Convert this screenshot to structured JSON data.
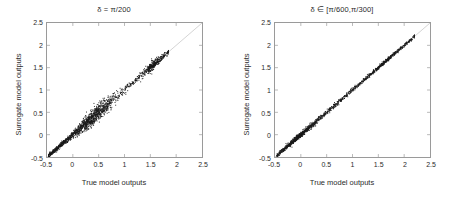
{
  "figure": {
    "background": "#ffffff",
    "point_color": "#1a1a1a",
    "reference_line_color": "#c8c8c8",
    "axis_color": "#9a9a9a"
  },
  "panels": [
    {
      "id": "left",
      "title": "δ = π/200",
      "xlabel": "True model outputs",
      "ylabel": "Surrogate model outputs"
    },
    {
      "id": "right",
      "title": "δ ∈ [π/600,π/300]",
      "xlabel": "True model outputs",
      "ylabel": "Surrogate model outputs"
    }
  ],
  "axis_ticks": {
    "x": [
      "-0.5",
      "0",
      "0.5",
      "1",
      "1.5",
      "2",
      "2.5"
    ],
    "y": [
      "-0.5",
      "0",
      "0.5",
      "1",
      "1.5",
      "2",
      "2.5"
    ]
  },
  "chart_data": [
    {
      "type": "scatter",
      "title": "δ = π/200",
      "xlabel": "True model outputs",
      "ylabel": "Surrogate model outputs",
      "xlim": [
        -0.5,
        2.5
      ],
      "ylim": [
        -0.5,
        2.5
      ],
      "xticks": [
        -0.5,
        0,
        0.5,
        1,
        1.5,
        2,
        2.5
      ],
      "yticks": [
        -0.5,
        0,
        0.5,
        1,
        1.5,
        2,
        2.5
      ],
      "grid": false,
      "legend": "none",
      "annotations": [
        "identity reference line y = x drawn in light gray across full axes range",
        "dense black point cloud hugging the diagonal from about -0.45 to 1.85",
        "visible vertical scatter spread widest between x = 0.2 and x = 0.8",
        "a secondary denser knot of points near x = 1.45 to 1.7"
      ],
      "marker": {
        "style": "dot",
        "size": 1.2,
        "color": "#1a1a1a"
      },
      "reference_line": {
        "slope": 1,
        "intercept": 0,
        "color": "#c8c8c8"
      },
      "n_points_approx": 1600,
      "data_x_range": [
        -0.47,
        1.85
      ],
      "data_y_range": [
        -0.47,
        1.83
      ],
      "residual_spread": "moderate; scatter band roughly +/-0.08 in y about the identity line, widening to +/-0.15 near x = 0.5",
      "points": [
        [
          -0.47,
          -0.47
        ],
        [
          -0.45,
          -0.46
        ],
        [
          -0.43,
          -0.44
        ],
        [
          -0.41,
          -0.42
        ],
        [
          -0.39,
          -0.4
        ],
        [
          -0.36,
          -0.37
        ],
        [
          -0.34,
          -0.35
        ],
        [
          -0.31,
          -0.32
        ],
        [
          -0.29,
          -0.29
        ],
        [
          -0.26,
          -0.27
        ],
        [
          -0.24,
          -0.25
        ],
        [
          -0.21,
          -0.21
        ],
        [
          -0.19,
          -0.2
        ],
        [
          -0.16,
          -0.17
        ],
        [
          -0.14,
          -0.13
        ],
        [
          -0.11,
          -0.12
        ],
        [
          -0.09,
          -0.08
        ],
        [
          -0.06,
          -0.07
        ],
        [
          -0.04,
          -0.03
        ],
        [
          -0.01,
          -0.02
        ],
        [
          0.02,
          0.03
        ],
        [
          0.05,
          0.04
        ],
        [
          0.07,
          0.09
        ],
        [
          0.1,
          0.08
        ],
        [
          0.12,
          0.14
        ],
        [
          0.15,
          0.13
        ],
        [
          0.18,
          0.2
        ],
        [
          0.2,
          0.18
        ],
        [
          0.23,
          0.26
        ],
        [
          0.25,
          0.23
        ],
        [
          0.28,
          0.31
        ],
        [
          0.3,
          0.27
        ],
        [
          0.33,
          0.37
        ],
        [
          0.35,
          0.32
        ],
        [
          0.38,
          0.43
        ],
        [
          0.4,
          0.36
        ],
        [
          0.43,
          0.48
        ],
        [
          0.45,
          0.41
        ],
        [
          0.48,
          0.53
        ],
        [
          0.5,
          0.46
        ],
        [
          0.53,
          0.58
        ],
        [
          0.55,
          0.51
        ],
        [
          0.58,
          0.62
        ],
        [
          0.6,
          0.57
        ],
        [
          0.63,
          0.66
        ],
        [
          0.65,
          0.62
        ],
        [
          0.68,
          0.71
        ],
        [
          0.7,
          0.67
        ],
        [
          0.73,
          0.75
        ],
        [
          0.75,
          0.73
        ],
        [
          0.8,
          0.79
        ],
        [
          0.85,
          0.84
        ],
        [
          0.9,
          0.89
        ],
        [
          0.95,
          0.95
        ],
        [
          1.0,
          0.99
        ],
        [
          1.05,
          1.05
        ],
        [
          1.1,
          1.09
        ],
        [
          1.15,
          1.15
        ],
        [
          1.2,
          1.2
        ],
        [
          1.25,
          1.24
        ],
        [
          1.3,
          1.31
        ],
        [
          1.35,
          1.34
        ],
        [
          1.4,
          1.41
        ],
        [
          1.45,
          1.44
        ],
        [
          1.48,
          1.5
        ],
        [
          1.5,
          1.47
        ],
        [
          1.53,
          1.55
        ],
        [
          1.55,
          1.52
        ],
        [
          1.58,
          1.6
        ],
        [
          1.6,
          1.57
        ],
        [
          1.63,
          1.63
        ],
        [
          1.66,
          1.67
        ],
        [
          1.7,
          1.7
        ],
        [
          1.74,
          1.73
        ],
        [
          1.78,
          1.77
        ],
        [
          1.82,
          1.8
        ],
        [
          1.85,
          1.83
        ]
      ]
    },
    {
      "type": "scatter",
      "title": "δ ∈ [π/600,π/300]",
      "xlabel": "True model outputs",
      "ylabel": "Surrogate model outputs",
      "xlim": [
        -0.5,
        2.5
      ],
      "ylim": [
        -0.5,
        2.5
      ],
      "xticks": [
        -0.5,
        0,
        0.5,
        1,
        1.5,
        2,
        2.5
      ],
      "yticks": [
        -0.5,
        0,
        0.5,
        1,
        1.5,
        2,
        2.5
      ],
      "grid": false,
      "legend": "none",
      "annotations": [
        "identity reference line y = x drawn in light gray across full axes range",
        "very tight black point cloud on the diagonal from about -0.45 to 2.20",
        "noticeably narrower scatter band than the left panel",
        "small cluster knots near x = -0.15, x = 0.0 and x = 1.6"
      ],
      "marker": {
        "style": "dot",
        "size": 1.2,
        "color": "#1a1a1a"
      },
      "reference_line": {
        "slope": 1,
        "intercept": 0,
        "color": "#c8c8c8"
      },
      "n_points_approx": 1800,
      "data_x_range": [
        -0.46,
        2.2
      ],
      "data_y_range": [
        -0.46,
        2.18
      ],
      "residual_spread": "tight; scatter band roughly +/-0.04 in y about the identity line across the whole range",
      "points": [
        [
          -0.46,
          -0.46
        ],
        [
          -0.43,
          -0.44
        ],
        [
          -0.4,
          -0.4
        ],
        [
          -0.37,
          -0.38
        ],
        [
          -0.34,
          -0.34
        ],
        [
          -0.31,
          -0.32
        ],
        [
          -0.28,
          -0.28
        ],
        [
          -0.25,
          -0.26
        ],
        [
          -0.22,
          -0.22
        ],
        [
          -0.19,
          -0.2
        ],
        [
          -0.16,
          -0.15
        ],
        [
          -0.13,
          -0.14
        ],
        [
          -0.1,
          -0.1
        ],
        [
          -0.07,
          -0.07
        ],
        [
          -0.04,
          -0.04
        ],
        [
          -0.01,
          -0.01
        ],
        [
          0.02,
          0.02
        ],
        [
          0.05,
          0.05
        ],
        [
          0.09,
          0.08
        ],
        [
          0.12,
          0.13
        ],
        [
          0.15,
          0.15
        ],
        [
          0.19,
          0.18
        ],
        [
          0.22,
          0.23
        ],
        [
          0.26,
          0.25
        ],
        [
          0.29,
          0.3
        ],
        [
          0.33,
          0.32
        ],
        [
          0.36,
          0.37
        ],
        [
          0.4,
          0.39
        ],
        [
          0.43,
          0.44
        ],
        [
          0.47,
          0.46
        ],
        [
          0.5,
          0.51
        ],
        [
          0.54,
          0.53
        ],
        [
          0.57,
          0.58
        ],
        [
          0.61,
          0.6
        ],
        [
          0.64,
          0.65
        ],
        [
          0.68,
          0.67
        ],
        [
          0.71,
          0.72
        ],
        [
          0.75,
          0.74
        ],
        [
          0.79,
          0.79
        ],
        [
          0.83,
          0.82
        ],
        [
          0.87,
          0.87
        ],
        [
          0.91,
          0.9
        ],
        [
          0.95,
          0.95
        ],
        [
          0.99,
          0.98
        ],
        [
          1.03,
          1.03
        ],
        [
          1.07,
          1.06
        ],
        [
          1.11,
          1.11
        ],
        [
          1.15,
          1.14
        ],
        [
          1.19,
          1.19
        ],
        [
          1.23,
          1.22
        ],
        [
          1.27,
          1.27
        ],
        [
          1.31,
          1.3
        ],
        [
          1.35,
          1.36
        ],
        [
          1.39,
          1.38
        ],
        [
          1.43,
          1.44
        ],
        [
          1.47,
          1.46
        ],
        [
          1.51,
          1.52
        ],
        [
          1.55,
          1.54
        ],
        [
          1.59,
          1.61
        ],
        [
          1.63,
          1.62
        ],
        [
          1.67,
          1.68
        ],
        [
          1.71,
          1.7
        ],
        [
          1.75,
          1.76
        ],
        [
          1.79,
          1.78
        ],
        [
          1.83,
          1.83
        ],
        [
          1.87,
          1.86
        ],
        [
          1.91,
          1.91
        ],
        [
          1.95,
          1.94
        ],
        [
          1.99,
          1.99
        ],
        [
          2.03,
          2.02
        ],
        [
          2.07,
          2.07
        ],
        [
          2.11,
          2.1
        ],
        [
          2.15,
          2.15
        ],
        [
          2.2,
          2.18
        ]
      ]
    }
  ]
}
